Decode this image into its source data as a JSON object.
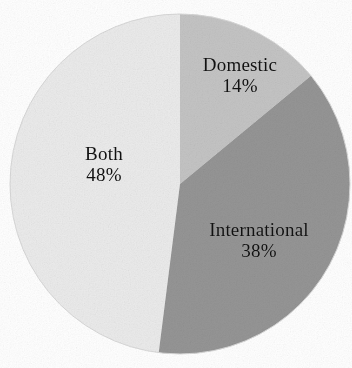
{
  "chart_data": {
    "type": "pie",
    "title": "",
    "subtitle": "",
    "xlabel": "",
    "ylabel": "",
    "legend": "none",
    "grid": false,
    "labels_inside": true,
    "start_angle_deg": 0,
    "direction": "clockwise",
    "total_percent": 100,
    "categories": [
      "Domestic",
      "International",
      "Both"
    ],
    "values": [
      14,
      38,
      48
    ],
    "value_unit": "%",
    "slices": [
      {
        "name": "Domestic",
        "value": 14,
        "value_label": "14%",
        "color": "#c4c4c4",
        "start_deg": 0,
        "end_deg": 50.4
      },
      {
        "name": "International",
        "value": 38,
        "value_label": "38%",
        "color": "#959595",
        "start_deg": 50.4,
        "end_deg": 187.2
      },
      {
        "name": "Both",
        "value": 48,
        "value_label": "48%",
        "color": "#ebebeb",
        "start_deg": 187.2,
        "end_deg": 360
      }
    ],
    "geometry": {
      "center_x": 180,
      "center_y": 184,
      "radius": 170
    },
    "background_color": "#ffffff",
    "text_color": "#111111"
  },
  "labels": {
    "domestic": {
      "name": "Domestic",
      "value": "14%"
    },
    "international": {
      "name": "International",
      "value": "38%"
    },
    "both": {
      "name": "Both",
      "value": "48%"
    }
  }
}
